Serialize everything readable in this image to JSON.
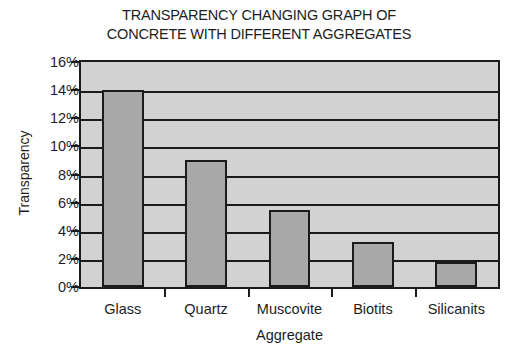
{
  "chart_data": {
    "type": "bar",
    "title": "TRANSPARENCY CHANGING GRAPH OF\nCONCRETE WITH DIFFERENT AGGREGATES",
    "xlabel": "Aggregate",
    "ylabel": "Transparency",
    "categories": [
      "Glass",
      "Quartz",
      "Muscovite",
      "Biotits",
      "Silicanits"
    ],
    "values": [
      14.0,
      9.0,
      5.5,
      3.2,
      1.8
    ],
    "value_labels": [
      "14%",
      "9%",
      "5.5%",
      "3.2%",
      "1.8%"
    ],
    "ylim": [
      0,
      16
    ],
    "ytick_values": [
      0,
      2,
      4,
      6,
      8,
      10,
      12,
      14,
      16
    ],
    "ytick_labels": [
      "0%",
      "2%",
      "4%",
      "6%",
      "8%",
      "10%",
      "12%",
      "14%",
      "16%"
    ],
    "grid": true,
    "legend": null,
    "series": [
      {
        "name": "Transparency",
        "values": [
          14.0,
          9.0,
          5.5,
          3.2,
          1.8
        ]
      }
    ]
  },
  "style": {
    "plot_background": "#d2d2d2",
    "bar_fill": "#a8a8a8",
    "line_color": "#1b1b1b",
    "text_color": "#1d1d1d",
    "page_background": "#ffffff"
  }
}
